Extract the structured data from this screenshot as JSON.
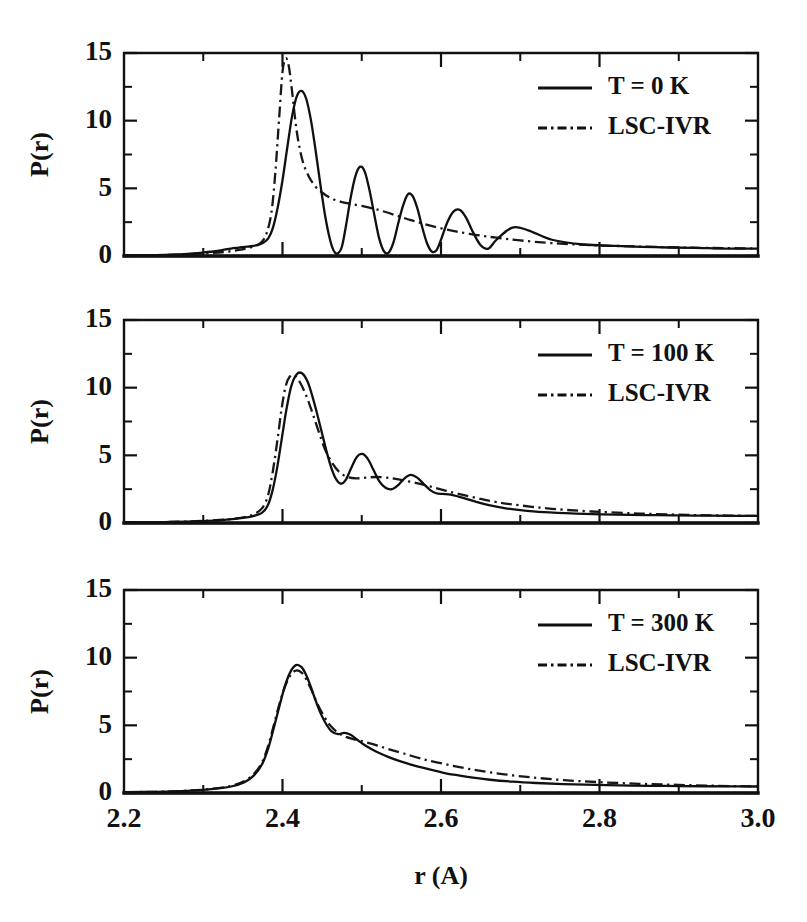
{
  "figure": {
    "xlabel": "r (A)",
    "ylabel": "P(r)",
    "xtick_labels": [
      "2.2",
      "2.4",
      "2.6",
      "2.8",
      "3.0"
    ],
    "ytick_labels": [
      "0",
      "5",
      "10",
      "15"
    ]
  },
  "chart_data": {
    "type": "line",
    "title": "",
    "xlabel": "r (A)",
    "ylabel": "P(r)",
    "xlim": [
      2.2,
      3.0
    ],
    "ylim": [
      0,
      15
    ],
    "xticks": [
      2.2,
      2.4,
      2.6,
      2.8,
      3.0
    ],
    "xticks_minor": [
      2.3,
      2.5,
      2.7,
      2.9
    ],
    "yticks": [
      0,
      5,
      10,
      15
    ],
    "yticks_minor": [
      2.5,
      7.5,
      12.5
    ],
    "grid": false,
    "legend_position": "upper-right",
    "panels": [
      {
        "id": "panel-0k",
        "legend": [
          "T = 0 K",
          "LSC-IVR"
        ],
        "series": [
          {
            "name": "T = 0 K",
            "style": "solid",
            "x": [
              2.2,
              2.23,
              2.26,
              2.28,
              2.3,
              2.315,
              2.325,
              2.335,
              2.345,
              2.352,
              2.36,
              2.368,
              2.375,
              2.382,
              2.388,
              2.394,
              2.4,
              2.406,
              2.412,
              2.418,
              2.424,
              2.43,
              2.436,
              2.442,
              2.448,
              2.454,
              2.46,
              2.465,
              2.47,
              2.475,
              2.48,
              2.486,
              2.492,
              2.498,
              2.504,
              2.51,
              2.516,
              2.522,
              2.528,
              2.534,
              2.54,
              2.546,
              2.552,
              2.558,
              2.564,
              2.57,
              2.576,
              2.582,
              2.588,
              2.594,
              2.6,
              2.608,
              2.616,
              2.624,
              2.632,
              2.64,
              2.65,
              2.66,
              2.67,
              2.69,
              2.71,
              2.74,
              2.78,
              2.82,
              2.87,
              2.92,
              2.96,
              3.0
            ],
            "y": [
              0.05,
              0.06,
              0.1,
              0.16,
              0.26,
              0.35,
              0.45,
              0.55,
              0.62,
              0.68,
              0.72,
              0.8,
              0.95,
              1.3,
              2.1,
              3.6,
              5.6,
              8.0,
              10.3,
              11.8,
              12.2,
              11.6,
              10.0,
              7.7,
              5.2,
              2.9,
              1.2,
              0.35,
              0.2,
              0.7,
              2.2,
              4.3,
              5.9,
              6.6,
              6.2,
              4.8,
              3.0,
              1.3,
              0.35,
              0.25,
              1.0,
              2.4,
              3.7,
              4.55,
              4.45,
              3.55,
              2.2,
              1.0,
              0.35,
              0.4,
              1.2,
              2.5,
              3.3,
              3.4,
              2.8,
              1.8,
              0.8,
              0.55,
              1.2,
              2.1,
              1.9,
              1.2,
              0.85,
              0.75,
              0.65,
              0.6,
              0.55,
              0.55
            ]
          },
          {
            "name": "LSC-IVR",
            "style": "dash-dot",
            "x": [
              2.2,
              2.24,
              2.28,
              2.31,
              2.33,
              2.345,
              2.356,
              2.366,
              2.374,
              2.38,
              2.386,
              2.391,
              2.396,
              2.4,
              2.404,
              2.408,
              2.412,
              2.418,
              2.425,
              2.433,
              2.442,
              2.452,
              2.462,
              2.474,
              2.486,
              2.5,
              2.515,
              2.53,
              2.546,
              2.562,
              2.58,
              2.6,
              2.62,
              2.645,
              2.67,
              2.7,
              2.74,
              2.79,
              2.85,
              2.91,
              2.96,
              3.0
            ],
            "y": [
              0.04,
              0.06,
              0.12,
              0.22,
              0.32,
              0.45,
              0.58,
              0.75,
              1.05,
              1.7,
              3.2,
              6.2,
              10.4,
              13.6,
              14.6,
              14.0,
              12.2,
              9.2,
              7.1,
              5.9,
              5.1,
              4.6,
              4.25,
              4.0,
              3.85,
              3.7,
              3.5,
              3.25,
              2.95,
              2.65,
              2.35,
              2.05,
              1.8,
              1.55,
              1.35,
              1.15,
              0.95,
              0.8,
              0.7,
              0.62,
              0.58,
              0.55
            ]
          }
        ]
      },
      {
        "id": "panel-100k",
        "legend": [
          "T = 100 K",
          "LSC-IVR"
        ],
        "series": [
          {
            "name": "T = 100 K",
            "style": "solid",
            "x": [
              2.2,
              2.25,
              2.29,
              2.32,
              2.34,
              2.355,
              2.365,
              2.374,
              2.381,
              2.387,
              2.393,
              2.399,
              2.405,
              2.411,
              2.418,
              2.425,
              2.432,
              2.438,
              2.444,
              2.45,
              2.456,
              2.462,
              2.468,
              2.474,
              2.48,
              2.487,
              2.494,
              2.501,
              2.508,
              2.515,
              2.522,
              2.53,
              2.538,
              2.546,
              2.554,
              2.562,
              2.57,
              2.578,
              2.586,
              2.594,
              2.602,
              2.612,
              2.622,
              2.634,
              2.648,
              2.662,
              2.68,
              2.7,
              2.73,
              2.77,
              2.82,
              2.87,
              2.92,
              2.97,
              3.0
            ],
            "y": [
              0.05,
              0.07,
              0.12,
              0.2,
              0.3,
              0.42,
              0.55,
              0.75,
              1.25,
              2.3,
              4.0,
              6.2,
              8.4,
              10.1,
              11.0,
              11.05,
              10.4,
              9.3,
              8.0,
              6.6,
              5.2,
              4.0,
              3.2,
              2.9,
              3.2,
              4.1,
              4.9,
              5.1,
              4.7,
              3.9,
              3.1,
              2.6,
              2.5,
              2.8,
              3.3,
              3.55,
              3.35,
              2.9,
              2.45,
              2.2,
              2.15,
              2.1,
              1.95,
              1.75,
              1.5,
              1.3,
              1.1,
              0.95,
              0.8,
              0.7,
              0.62,
              0.58,
              0.55,
              0.52,
              0.52
            ]
          },
          {
            "name": "LSC-IVR",
            "style": "dash-dot",
            "x": [
              2.2,
              2.25,
              2.29,
              2.32,
              2.34,
              2.355,
              2.366,
              2.375,
              2.382,
              2.388,
              2.394,
              2.399,
              2.404,
              2.409,
              2.415,
              2.422,
              2.43,
              2.438,
              2.446,
              2.454,
              2.463,
              2.472,
              2.482,
              2.493,
              2.505,
              2.518,
              2.532,
              2.548,
              2.565,
              2.583,
              2.602,
              2.622,
              2.645,
              2.67,
              2.7,
              2.74,
              2.79,
              2.85,
              2.91,
              2.96,
              3.0
            ],
            "y": [
              0.05,
              0.07,
              0.13,
              0.22,
              0.33,
              0.48,
              0.7,
              1.15,
              2.1,
              3.9,
              6.3,
              8.5,
              10.1,
              10.8,
              10.9,
              10.4,
              9.4,
              8.1,
              6.7,
              5.4,
              4.4,
              3.75,
              3.4,
              3.3,
              3.35,
              3.4,
              3.35,
              3.2,
              3.0,
              2.75,
              2.45,
              2.15,
              1.85,
              1.55,
              1.3,
              1.05,
              0.85,
              0.7,
              0.6,
              0.55,
              0.52
            ]
          }
        ]
      },
      {
        "id": "panel-300k",
        "legend": [
          "T = 300 K",
          "LSC-IVR"
        ],
        "series": [
          {
            "name": "T = 300 K",
            "style": "solid",
            "x": [
              2.2,
              2.24,
              2.28,
              2.31,
              2.335,
              2.352,
              2.364,
              2.374,
              2.382,
              2.389,
              2.396,
              2.403,
              2.41,
              2.417,
              2.424,
              2.43,
              2.436,
              2.442,
              2.448,
              2.455,
              2.462,
              2.47,
              2.478,
              2.486,
              2.494,
              2.502,
              2.512,
              2.522,
              2.534,
              2.548,
              2.562,
              2.578,
              2.596,
              2.616,
              2.638,
              2.662,
              2.69,
              2.72,
              2.755,
              2.795,
              2.84,
              2.885,
              2.93,
              2.97,
              3.0
            ],
            "y": [
              0.06,
              0.09,
              0.16,
              0.28,
              0.48,
              0.8,
              1.3,
              2.1,
              3.3,
              4.8,
              6.4,
              7.9,
              8.95,
              9.45,
              9.3,
              8.7,
              7.8,
              6.8,
              5.9,
              5.1,
              4.55,
              4.35,
              4.45,
              4.3,
              3.95,
              3.6,
              3.25,
              2.95,
              2.65,
              2.35,
              2.1,
              1.85,
              1.6,
              1.35,
              1.15,
              0.98,
              0.84,
              0.74,
              0.66,
              0.6,
              0.55,
              0.52,
              0.5,
              0.49,
              0.48
            ]
          },
          {
            "name": "LSC-IVR",
            "style": "dash-dot",
            "x": [
              2.2,
              2.24,
              2.28,
              2.31,
              2.335,
              2.352,
              2.364,
              2.374,
              2.382,
              2.389,
              2.396,
              2.403,
              2.41,
              2.417,
              2.424,
              2.43,
              2.437,
              2.444,
              2.452,
              2.46,
              2.47,
              2.48,
              2.492,
              2.505,
              2.52,
              2.536,
              2.554,
              2.574,
              2.596,
              2.62,
              2.648,
              2.68,
              2.715,
              2.755,
              2.8,
              2.85,
              2.9,
              2.95,
              3.0
            ],
            "y": [
              0.06,
              0.09,
              0.17,
              0.3,
              0.52,
              0.88,
              1.42,
              2.25,
              3.5,
              5.0,
              6.55,
              7.85,
              8.7,
              9.05,
              8.9,
              8.4,
              7.55,
              6.6,
              5.7,
              5.0,
              4.45,
              4.15,
              3.95,
              3.75,
              3.5,
              3.2,
              2.9,
              2.55,
              2.25,
              1.95,
              1.65,
              1.38,
              1.15,
              0.95,
              0.8,
              0.68,
              0.6,
              0.53,
              0.48
            ]
          }
        ]
      }
    ]
  }
}
